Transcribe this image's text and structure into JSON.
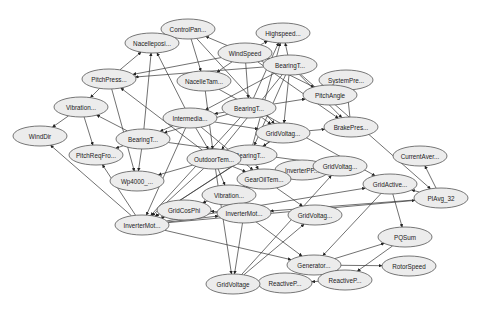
{
  "diagram": {
    "type": "directed-graph",
    "node_fill": "#ececec",
    "node_stroke": "#555555",
    "edge_color": "#333333",
    "nodes": [
      {
        "id": "controlpan",
        "label": "ControlPan...",
        "x": 188,
        "y": 29
      },
      {
        "id": "nacelleposi",
        "label": "Nacelleposi...",
        "x": 152,
        "y": 43
      },
      {
        "id": "highspeed",
        "label": "Highspeed...",
        "x": 283,
        "y": 33
      },
      {
        "id": "windspeed",
        "label": "WindSpeed",
        "x": 245,
        "y": 53
      },
      {
        "id": "bearingt_top",
        "label": "BearingT...",
        "x": 290,
        "y": 65
      },
      {
        "id": "pitchpress",
        "label": "PitchPress...",
        "x": 109,
        "y": 79
      },
      {
        "id": "nacelletam",
        "label": "NacelleTam...",
        "x": 204,
        "y": 81
      },
      {
        "id": "systempre",
        "label": "SystemPre...",
        "x": 346,
        "y": 80
      },
      {
        "id": "pitchangle",
        "label": "PitchAngle",
        "x": 330,
        "y": 95
      },
      {
        "id": "vibration_left",
        "label": "Vibration...",
        "x": 81,
        "y": 107
      },
      {
        "id": "intermedia",
        "label": "Intermedia...",
        "x": 190,
        "y": 118
      },
      {
        "id": "bearingt_mid",
        "label": "BearingT...",
        "x": 249,
        "y": 108
      },
      {
        "id": "brakepres",
        "label": "BrakePres...",
        "x": 351,
        "y": 127
      },
      {
        "id": "winddir",
        "label": "WindDir",
        "x": 40,
        "y": 136
      },
      {
        "id": "bearingt_left",
        "label": "BearingT...",
        "x": 143,
        "y": 139
      },
      {
        "id": "gridvoltag_upper",
        "label": "GridVoltag...",
        "x": 283,
        "y": 133
      },
      {
        "id": "bearingt_center",
        "label": "BearingT...",
        "x": 250,
        "y": 155
      },
      {
        "id": "outdoortem",
        "label": "OutdoorTem...",
        "x": 214,
        "y": 159
      },
      {
        "id": "pitchreqfro",
        "label": "PitchReqFro...",
        "x": 96,
        "y": 155
      },
      {
        "id": "currentaver",
        "label": "CurrentAver...",
        "x": 420,
        "y": 156
      },
      {
        "id": "inverterpp",
        "label": "InverterPP...",
        "x": 302,
        "y": 170
      },
      {
        "id": "gridvoltag_midright",
        "label": "GridVoltag...",
        "x": 340,
        "y": 166
      },
      {
        "id": "gearoiltem",
        "label": "GearOilTem...",
        "x": 264,
        "y": 179
      },
      {
        "id": "wp4000",
        "label": "Wp4000_...",
        "x": 137,
        "y": 181
      },
      {
        "id": "vibration_center",
        "label": "Vibration...",
        "x": 229,
        "y": 195
      },
      {
        "id": "gridactive",
        "label": "GridActive...",
        "x": 390,
        "y": 184
      },
      {
        "id": "piavg32",
        "label": "PIAvg_32",
        "x": 441,
        "y": 198
      },
      {
        "id": "gridcosphi",
        "label": "GridCosPhi",
        "x": 184,
        "y": 210
      },
      {
        "id": "invertermot_center",
        "label": "InverterMot...",
        "x": 244,
        "y": 213
      },
      {
        "id": "gridvoltag_lower",
        "label": "GridVoltag...",
        "x": 315,
        "y": 215
      },
      {
        "id": "invertermot_left",
        "label": "InverterMot...",
        "x": 142,
        "y": 225
      },
      {
        "id": "pqsum",
        "label": "PQSum",
        "x": 405,
        "y": 237
      },
      {
        "id": "generator",
        "label": "Generator...",
        "x": 314,
        "y": 265
      },
      {
        "id": "rotorspeed",
        "label": "RotorSpeed",
        "x": 409,
        "y": 266
      },
      {
        "id": "reactivep_right",
        "label": "ReactiveP...",
        "x": 345,
        "y": 280
      },
      {
        "id": "reactivep_left",
        "label": "ReactiveP...",
        "x": 285,
        "y": 283
      },
      {
        "id": "gridvoltage",
        "label": "GridVoltage",
        "x": 233,
        "y": 284
      }
    ],
    "edges": [
      [
        "windspeed",
        "controlpan"
      ],
      [
        "windspeed",
        "highspeed"
      ],
      [
        "windspeed",
        "pitchpress"
      ],
      [
        "windspeed",
        "pitchangle"
      ],
      [
        "windspeed",
        "bearingt_mid"
      ],
      [
        "windspeed",
        "brakepres"
      ],
      [
        "windspeed",
        "nacelletam"
      ],
      [
        "bearingt_top",
        "highspeed"
      ],
      [
        "bearingt_top",
        "windspeed"
      ],
      [
        "bearingt_top",
        "pitchpress"
      ],
      [
        "bearingt_top",
        "brakepres"
      ],
      [
        "bearingt_top",
        "gridvoltag_upper"
      ],
      [
        "bearingt_top",
        "intermedia"
      ],
      [
        "bearingt_top",
        "outdoortem"
      ],
      [
        "bearingt_top",
        "bearingt_center"
      ],
      [
        "pitchpress",
        "nacelleposi"
      ],
      [
        "pitchpress",
        "vibration_left"
      ],
      [
        "pitchpress",
        "wp4000"
      ],
      [
        "controlpan",
        "nacelletam"
      ],
      [
        "controlpan",
        "gridvoltag_upper"
      ],
      [
        "nacelletam",
        "outdoortem"
      ],
      [
        "nacelletam",
        "gridactive"
      ],
      [
        "pitchangle",
        "systempre"
      ],
      [
        "brakepres",
        "systempre"
      ],
      [
        "vibration_left",
        "winddir"
      ],
      [
        "vibration_left",
        "pitchreqfro"
      ],
      [
        "intermedia",
        "nacelleposi"
      ],
      [
        "intermedia",
        "bearingt_left"
      ],
      [
        "intermedia",
        "outdoortem"
      ],
      [
        "intermedia",
        "gridvoltag_upper"
      ],
      [
        "intermedia",
        "invertermot_left"
      ],
      [
        "intermedia",
        "gearoiltem"
      ],
      [
        "bearingt_mid",
        "highspeed"
      ],
      [
        "bearingt_mid",
        "intermedia"
      ],
      [
        "bearingt_mid",
        "pitchangle"
      ],
      [
        "bearingt_mid",
        "gridvoltag_upper"
      ],
      [
        "bearingt_mid",
        "invertermot_left"
      ],
      [
        "bearingt_mid",
        "bearingt_left"
      ],
      [
        "bearingt_left",
        "nacelleposi"
      ],
      [
        "bearingt_left",
        "pitchreqfro"
      ],
      [
        "bearingt_left",
        "wp4000"
      ],
      [
        "bearingt_left",
        "vibration_left"
      ],
      [
        "bearingt_left",
        "gridvoltag_midright"
      ],
      [
        "gridvoltag_upper",
        "brakepres"
      ],
      [
        "gridvoltag_upper",
        "bearingt_center"
      ],
      [
        "gridvoltag_upper",
        "invertermot_left"
      ],
      [
        "bearingt_center",
        "gearoiltem"
      ],
      [
        "bearingt_center",
        "highspeed"
      ],
      [
        "bearingt_center",
        "outdoortem"
      ],
      [
        "bearingt_center",
        "invertermot_left"
      ],
      [
        "outdoortem",
        "vibration_center"
      ],
      [
        "outdoortem",
        "wp4000"
      ],
      [
        "outdoortem",
        "invertermot_left"
      ],
      [
        "outdoortem",
        "gridvoltage"
      ],
      [
        "outdoortem",
        "gearoiltem"
      ],
      [
        "outdoortem",
        "pitchpress"
      ],
      [
        "gearoiltem",
        "vibration_center"
      ],
      [
        "gearoiltem",
        "gridvoltag_lower"
      ],
      [
        "gearoiltem",
        "gridcosphi"
      ],
      [
        "invertermot_left",
        "winddir"
      ],
      [
        "invertermot_left",
        "pitchreqfro"
      ],
      [
        "invertermot_left",
        "gridactive"
      ],
      [
        "invertermot_left",
        "piavg32"
      ],
      [
        "invertermot_left",
        "gridcosphi"
      ],
      [
        "invertermot_left",
        "invertermot_center"
      ],
      [
        "invertermot_left",
        "generator"
      ],
      [
        "invertermot_center",
        "gridcosphi"
      ],
      [
        "invertermot_center",
        "gridvoltage"
      ],
      [
        "invertermot_center",
        "generator"
      ],
      [
        "gridvoltage",
        "gridvoltag_lower"
      ],
      [
        "gridvoltage",
        "gridvoltag_midright"
      ],
      [
        "piavg32",
        "currentaver"
      ],
      [
        "piavg32",
        "gridactive"
      ],
      [
        "piavg32",
        "invertermot_center"
      ],
      [
        "bearingt_top",
        "piavg32"
      ],
      [
        "gridactive",
        "pqsum"
      ],
      [
        "gridactive",
        "generator"
      ],
      [
        "generator",
        "pqsum"
      ],
      [
        "generator",
        "rotorspeed"
      ],
      [
        "pqsum",
        "reactivep_right"
      ],
      [
        "reactivep_right",
        "reactivep_left"
      ]
    ]
  }
}
